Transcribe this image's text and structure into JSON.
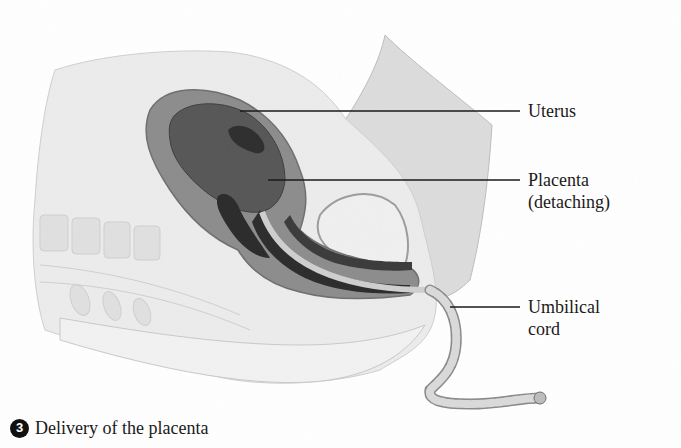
{
  "figure": {
    "labels": [
      {
        "id": "uterus",
        "text": "Uterus"
      },
      {
        "id": "placenta",
        "line1": "Placenta",
        "line2": "(detaching)"
      },
      {
        "id": "umbilical-cord",
        "line1": "Umbilical",
        "line2": "cord"
      }
    ],
    "caption": {
      "step_number": "3",
      "text": "Delivery of the placenta"
    },
    "colors": {
      "background": "#ffffff",
      "ink": "#1a1a1a",
      "tissue_light": "#e6e6e6",
      "tissue_mid": "#a8a8a8",
      "tissue_dark": "#5a5a5a",
      "tissue_darkest": "#2a2a2a"
    }
  }
}
